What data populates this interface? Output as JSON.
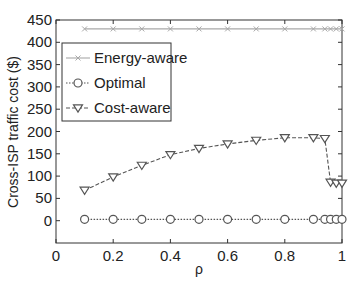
{
  "chart_data": {
    "type": "line",
    "title": "",
    "xlabel": "ρ",
    "ylabel": "Cross-ISP traffic cost ($)",
    "xlim": [
      0,
      1
    ],
    "ylim": [
      -50,
      450
    ],
    "xticks": [
      0,
      0.2,
      0.4,
      0.6,
      0.8,
      1
    ],
    "xtick_labels": [
      "0",
      "0.2",
      "0.4",
      "0.6",
      "0.8",
      "1"
    ],
    "yticks": [
      0,
      50,
      100,
      150,
      200,
      250,
      300,
      350,
      400,
      450
    ],
    "ytick_labels": [
      "0",
      "50",
      "100",
      "150",
      "200",
      "250",
      "300",
      "350",
      "400",
      "450"
    ],
    "grid": false,
    "legend_position": "upper-left",
    "series": [
      {
        "name": "Energy-aware",
        "marker": "x",
        "line_style": "solid",
        "color": "#a8a8a8",
        "x": [
          0.1,
          0.2,
          0.3,
          0.4,
          0.5,
          0.6,
          0.7,
          0.8,
          0.9,
          0.94,
          0.96,
          0.98,
          1.0
        ],
        "values": [
          430,
          430,
          430,
          430,
          430,
          430,
          430,
          430,
          430,
          430,
          430,
          430,
          430
        ]
      },
      {
        "name": "Optimal",
        "marker": "circle",
        "line_style": "dotted",
        "color": "#555555",
        "x": [
          0.1,
          0.2,
          0.3,
          0.4,
          0.5,
          0.6,
          0.7,
          0.8,
          0.9,
          0.94,
          0.96,
          0.98,
          1.0
        ],
        "values": [
          3,
          3,
          3,
          3,
          3,
          3,
          3,
          3,
          3,
          3,
          3,
          3,
          3
        ]
      },
      {
        "name": "Cost-aware",
        "marker": "triangle-down",
        "line_style": "dashed",
        "color": "#555555",
        "x": [
          0.1,
          0.2,
          0.3,
          0.4,
          0.5,
          0.6,
          0.7,
          0.8,
          0.9,
          0.94,
          0.96,
          0.98,
          1.0
        ],
        "values": [
          68,
          98,
          124,
          148,
          162,
          172,
          180,
          186,
          186,
          184,
          86,
          84,
          84
        ]
      }
    ]
  }
}
